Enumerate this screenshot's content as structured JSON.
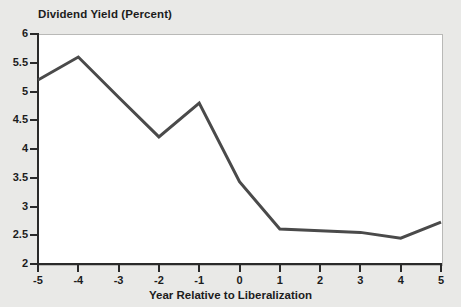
{
  "chart_data": {
    "type": "line",
    "title": "Dividend Yield (Percent)",
    "xlabel": "Year Relative to Liberalization",
    "ylabel": "",
    "x": [
      -5,
      -4,
      -3,
      -2,
      -1,
      0,
      1,
      2,
      3,
      4,
      5
    ],
    "values": [
      5.2,
      5.6,
      4.9,
      4.21,
      4.8,
      3.43,
      2.61,
      2.58,
      2.55,
      2.45,
      2.73
    ],
    "series": [
      {
        "name": "Dividend Yield (Percent)",
        "values": [
          5.2,
          5.6,
          4.9,
          4.21,
          4.8,
          3.43,
          2.61,
          2.58,
          2.55,
          2.45,
          2.73
        ]
      }
    ],
    "xlim": [
      -5,
      5
    ],
    "ylim": [
      2,
      6
    ],
    "xticks": [
      -5,
      -4,
      -3,
      -2,
      -1,
      0,
      1,
      2,
      3,
      4,
      5
    ],
    "xtick_labels": [
      "-5",
      "-4",
      "-3",
      "-2",
      "-1",
      "0",
      "1",
      "2",
      "3",
      "4",
      "5"
    ],
    "yticks": [
      2,
      2.5,
      3,
      3.5,
      4,
      4.5,
      5,
      5.5,
      6
    ],
    "ytick_labels": [
      "2",
      "2.5",
      "3",
      "3.5",
      "4",
      "4.5",
      "5",
      "5.5",
      "6"
    ],
    "grid": false,
    "legend": "none",
    "line_color": "#4a4a4a",
    "line_width": 3,
    "plot_background": "#ffffff",
    "figure_background": "#e9e9e7"
  }
}
